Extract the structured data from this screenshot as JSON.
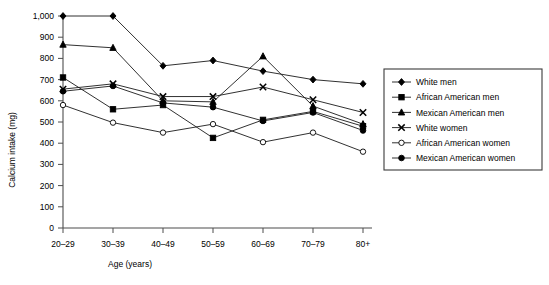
{
  "chart_data": {
    "type": "line",
    "title": "",
    "xlabel": "Age (years)",
    "ylabel": "Calcium intake (mg)",
    "categories": [
      "20–29",
      "30–39",
      "40–49",
      "50–59",
      "60–69",
      "70–79",
      "80+"
    ],
    "ylim": [
      0,
      1000
    ],
    "ytick_labels": [
      "0",
      "100",
      "200",
      "300",
      "400",
      "500",
      "600",
      "700",
      "800",
      "900",
      "1,000"
    ],
    "ytick_values": [
      0,
      100,
      200,
      300,
      400,
      500,
      600,
      700,
      800,
      900,
      1000
    ],
    "grid": false,
    "legend_position": "right",
    "series": [
      {
        "name": "White men",
        "marker": "filled-diamond",
        "values": [
          1000,
          1000,
          765,
          790,
          740,
          700,
          680
        ]
      },
      {
        "name": "African American men",
        "marker": "filled-square",
        "values": [
          710,
          560,
          580,
          425,
          510,
          550,
          480
        ]
      },
      {
        "name": "Mexican American men",
        "marker": "filled-triangle",
        "values": [
          865,
          850,
          600,
          595,
          810,
          575,
          490
        ]
      },
      {
        "name": "White women",
        "marker": "cross-x",
        "values": [
          655,
          680,
          620,
          620,
          665,
          605,
          545
        ]
      },
      {
        "name": "African American women",
        "marker": "open-circle",
        "values": [
          580,
          497,
          450,
          490,
          405,
          450,
          360
        ]
      },
      {
        "name": "Mexican American women",
        "marker": "filled-circle",
        "values": [
          645,
          670,
          590,
          570,
          505,
          545,
          460
        ]
      }
    ]
  },
  "legend": {
    "entries": [
      "White men",
      "African American men",
      "Mexican American men",
      "White women",
      "African American women",
      "Mexican American women"
    ]
  },
  "colors": {
    "ink": "#000000",
    "axis": "#4d4d4d",
    "background": "#ffffff"
  }
}
